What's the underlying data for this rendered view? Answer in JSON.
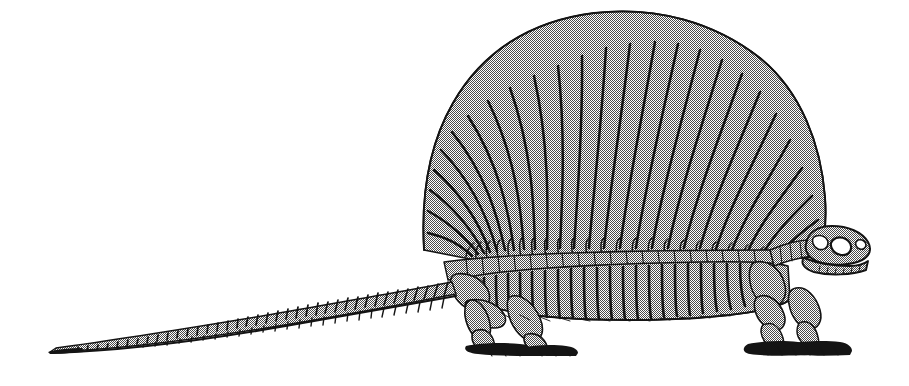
{
  "figure": {
    "title": "Dimetrodon skeleton lateral view",
    "subject_name": "Dimetrodon",
    "view": "lateral left-facing-right",
    "caption": "",
    "alt_text": "Line drawing of a Dimetrodon skeleton in left lateral view showing the tall neural-spine sail, ribcage, limbs and long tail"
  },
  "canvas": {
    "width": 909,
    "height": 386,
    "background_color": "#ffffff"
  },
  "style": {
    "ink_color": "#141414",
    "fill_color": "#c9c9c9",
    "halftone": "checkerboard-dither",
    "line_weight": 1.1
  },
  "anatomy": {
    "regions": [
      {
        "id": "skull",
        "label": "Skull",
        "x": 806,
        "y": 226,
        "w": 66,
        "h": 48
      },
      {
        "id": "cervical",
        "label": "Cervical vertebrae",
        "x": 772,
        "y": 232,
        "w": 42,
        "h": 30
      },
      {
        "id": "sail",
        "label": "Neural spine sail",
        "x": 424,
        "y": 12,
        "w": 400,
        "h": 245
      },
      {
        "id": "dorsal-column",
        "label": "Dorsal vertebral column",
        "x": 440,
        "y": 238,
        "w": 360,
        "h": 24
      },
      {
        "id": "ribcage",
        "label": "Ribcage",
        "x": 470,
        "y": 250,
        "w": 320,
        "h": 68
      },
      {
        "id": "pelvis",
        "label": "Pelvis",
        "x": 452,
        "y": 280,
        "w": 70,
        "h": 46
      },
      {
        "id": "hindlimb",
        "label": "Hind limb",
        "x": 452,
        "y": 290,
        "w": 110,
        "h": 62
      },
      {
        "id": "forelimb",
        "label": "Fore limb",
        "x": 746,
        "y": 278,
        "w": 102,
        "h": 62
      },
      {
        "id": "tail",
        "label": "Caudal vertebrae / tail",
        "x": 48,
        "y": 258,
        "w": 420,
        "h": 96
      }
    ],
    "sail_spine_count": 24,
    "rib_count": 22,
    "caudal_vertebra_count": 34
  },
  "bounds": {
    "leftmost_x": 48,
    "rightmost_x": 872,
    "topmost_y": 12,
    "bottommost_y": 356
  }
}
